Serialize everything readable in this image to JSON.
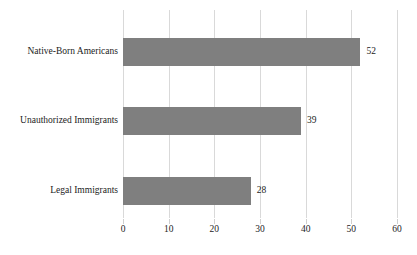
{
  "chart_data": {
    "type": "bar",
    "orientation": "horizontal",
    "title": "",
    "xlabel": "",
    "ylabel": "",
    "categories": [
      "Native-Born Americans",
      "Unauthorized Immigrants",
      "Legal Immigrants"
    ],
    "values": [
      52,
      39,
      28
    ],
    "value_labels": [
      "52",
      "39",
      "28"
    ],
    "xlim": [
      0,
      60
    ],
    "xticks": [
      0,
      10,
      20,
      30,
      40,
      50,
      60
    ],
    "xtick_labels": [
      "0",
      "10",
      "20",
      "30",
      "40",
      "50",
      "60"
    ],
    "grid": "vertical",
    "legend": "none",
    "series": [
      {
        "name": "",
        "values": [
          52,
          39,
          28
        ]
      }
    ]
  },
  "style": {
    "bar_color": "#7f7f7f",
    "gridline_color": "#d9d9d9",
    "text_color": "#1c1c1c",
    "background_color": "#ffffff"
  }
}
